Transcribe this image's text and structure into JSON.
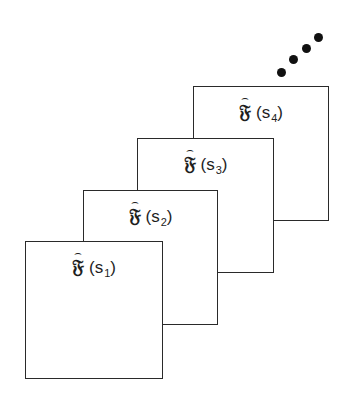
{
  "figure": {
    "frames": [
      {
        "symbol": "𝔉",
        "hat": "⌢",
        "open": "(",
        "var": "s",
        "sub": "1",
        "close": ")"
      },
      {
        "symbol": "𝔉",
        "hat": "⌢",
        "open": "(",
        "var": "s",
        "sub": "2",
        "close": ")"
      },
      {
        "symbol": "𝔉",
        "hat": "⌢",
        "open": "(",
        "var": "s",
        "sub": "3",
        "close": ")"
      },
      {
        "symbol": "𝔉",
        "hat": "⌢",
        "open": "(",
        "var": "s",
        "sub": "4",
        "close": ")"
      }
    ],
    "continuation": "ellipsis-dots",
    "line_color": "#2a2a2a",
    "dot_color": "#111111"
  }
}
